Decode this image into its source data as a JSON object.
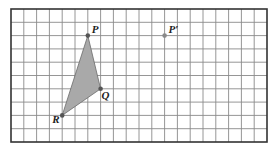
{
  "diagram": {
    "type": "coordinate-grid-translation",
    "grid": {
      "columns": 20,
      "rows": 10,
      "origin_px": [
        11,
        9
      ],
      "cell_w": 12.8,
      "cell_h": 13.3,
      "line_color": "#8a8a8a",
      "border_color": "#333333",
      "background": "#ffffff"
    },
    "triangle": {
      "fill": "#a9a9a9",
      "stroke": "#6b6b6b",
      "vertices": [
        {
          "label": "P",
          "col": 6,
          "row": 2
        },
        {
          "label": "Q",
          "col": 7,
          "row": 6
        },
        {
          "label": "R",
          "col": 4,
          "row": 8
        }
      ]
    },
    "points": [
      {
        "label": "P",
        "col": 6,
        "row": 2,
        "color": "#555555",
        "label_dx": 4,
        "label_dy": -3
      },
      {
        "label": "Q",
        "col": 7,
        "row": 6,
        "color": "#555555",
        "label_dx": 1,
        "label_dy": 10
      },
      {
        "label": "R",
        "col": 4,
        "row": 8,
        "color": "#555555",
        "label_dx": -10,
        "label_dy": 8
      },
      {
        "label": "P′",
        "col": 12,
        "row": 2,
        "color": "#8a8a8a",
        "label_dx": 4,
        "label_dy": -3
      }
    ]
  }
}
